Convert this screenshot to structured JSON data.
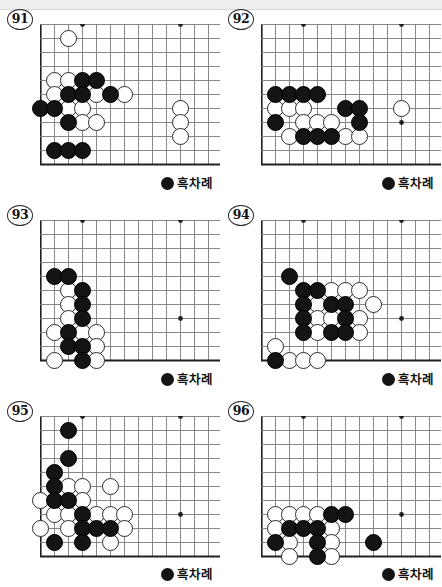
{
  "page": {
    "type": "go-problem-collection",
    "columns": 2,
    "rows": 3,
    "total_problems": 6
  },
  "board": {
    "cols": 13,
    "rows": 11,
    "spacing": 14,
    "origin_x": 0,
    "origin_y": 0,
    "edge_left": true,
    "edge_bottom": true,
    "line_color": "#7a7a7a",
    "edge_color": "#1f1f1f",
    "star_points": [
      [
        3,
        0
      ],
      [
        10,
        0
      ],
      [
        10,
        7
      ]
    ],
    "star_color": "#1f1f1f",
    "black_color": "#141414",
    "white_color": "#ffffff",
    "white_border": "#2b2b2b"
  },
  "turn_caption": {
    "label": "흑차례",
    "stone": "black"
  },
  "problems": [
    {
      "number": "91",
      "black": [
        [
          3,
          4
        ],
        [
          4,
          4
        ],
        [
          2,
          5
        ],
        [
          3,
          5
        ],
        [
          5,
          5
        ],
        [
          0,
          6
        ],
        [
          1,
          6
        ],
        [
          2,
          7
        ],
        [
          1,
          9
        ],
        [
          2,
          9
        ],
        [
          3,
          9
        ]
      ],
      "white": [
        [
          2,
          1
        ],
        [
          1,
          4
        ],
        [
          2,
          4
        ],
        [
          1,
          5
        ],
        [
          4,
          5
        ],
        [
          6,
          5
        ],
        [
          2,
          6
        ],
        [
          3,
          6
        ],
        [
          10,
          6
        ],
        [
          3,
          7
        ],
        [
          4,
          7
        ],
        [
          10,
          7
        ],
        [
          10,
          8
        ]
      ]
    },
    {
      "number": "92",
      "black": [
        [
          1,
          5
        ],
        [
          2,
          5
        ],
        [
          3,
          5
        ],
        [
          4,
          5
        ],
        [
          6,
          6
        ],
        [
          7,
          6
        ],
        [
          1,
          7
        ],
        [
          7,
          7
        ],
        [
          3,
          8
        ],
        [
          4,
          8
        ],
        [
          5,
          8
        ]
      ],
      "white": [
        [
          1,
          6
        ],
        [
          2,
          6
        ],
        [
          3,
          6
        ],
        [
          10,
          6
        ],
        [
          3,
          7
        ],
        [
          4,
          7
        ],
        [
          5,
          7
        ],
        [
          2,
          8
        ],
        [
          6,
          8
        ],
        [
          7,
          8
        ]
      ]
    },
    {
      "number": "93",
      "black": [
        [
          1,
          4
        ],
        [
          2,
          4
        ],
        [
          3,
          5
        ],
        [
          3,
          6
        ],
        [
          3,
          7
        ],
        [
          2,
          8
        ],
        [
          2,
          9
        ],
        [
          3,
          9
        ],
        [
          3,
          10
        ]
      ],
      "white": [
        [
          2,
          5
        ],
        [
          2,
          6
        ],
        [
          2,
          7
        ],
        [
          1,
          8
        ],
        [
          3,
          8
        ],
        [
          4,
          8
        ],
        [
          4,
          9
        ],
        [
          1,
          10
        ],
        [
          4,
          10
        ]
      ]
    },
    {
      "number": "94",
      "black": [
        [
          2,
          4
        ],
        [
          3,
          5
        ],
        [
          4,
          5
        ],
        [
          3,
          6
        ],
        [
          5,
          6
        ],
        [
          6,
          6
        ],
        [
          3,
          7
        ],
        [
          6,
          7
        ],
        [
          3,
          8
        ],
        [
          5,
          8
        ],
        [
          6,
          8
        ],
        [
          1,
          10
        ]
      ],
      "white": [
        [
          5,
          5
        ],
        [
          6,
          5
        ],
        [
          7,
          5
        ],
        [
          4,
          6
        ],
        [
          8,
          6
        ],
        [
          4,
          7
        ],
        [
          5,
          7
        ],
        [
          7,
          7
        ],
        [
          4,
          8
        ],
        [
          7,
          8
        ],
        [
          1,
          9
        ],
        [
          2,
          10
        ],
        [
          3,
          10
        ],
        [
          4,
          10
        ]
      ]
    },
    {
      "number": "95",
      "black": [
        [
          2,
          1
        ],
        [
          2,
          3
        ],
        [
          1,
          4
        ],
        [
          1,
          5
        ],
        [
          1,
          6
        ],
        [
          2,
          6
        ],
        [
          3,
          7
        ],
        [
          3,
          8
        ],
        [
          4,
          8
        ],
        [
          5,
          8
        ],
        [
          1,
          9
        ],
        [
          3,
          9
        ]
      ],
      "white": [
        [
          2,
          5
        ],
        [
          3,
          5
        ],
        [
          5,
          5
        ],
        [
          0,
          6
        ],
        [
          3,
          6
        ],
        [
          1,
          7
        ],
        [
          2,
          7
        ],
        [
          4,
          7
        ],
        [
          5,
          7
        ],
        [
          6,
          7
        ],
        [
          0,
          8
        ],
        [
          2,
          8
        ],
        [
          6,
          8
        ],
        [
          5,
          9
        ]
      ]
    },
    {
      "number": "96",
      "black": [
        [
          5,
          7
        ],
        [
          6,
          7
        ],
        [
          2,
          8
        ],
        [
          3,
          8
        ],
        [
          4,
          8
        ],
        [
          1,
          9
        ],
        [
          4,
          9
        ],
        [
          8,
          9
        ],
        [
          4,
          10
        ]
      ],
      "white": [
        [
          1,
          7
        ],
        [
          2,
          7
        ],
        [
          3,
          7
        ],
        [
          4,
          7
        ],
        [
          1,
          8
        ],
        [
          5,
          8
        ],
        [
          2,
          9
        ],
        [
          5,
          9
        ],
        [
          2,
          10
        ],
        [
          5,
          10
        ]
      ]
    }
  ]
}
